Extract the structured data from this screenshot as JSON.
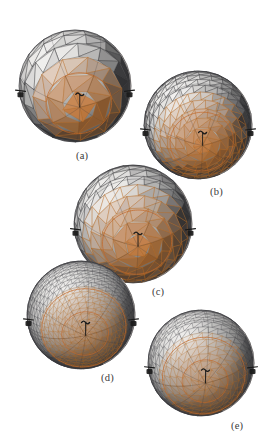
{
  "figure": {
    "background_color": "#ffffff",
    "width": 269,
    "height": 445,
    "type": "scientific-illustration",
    "shading": {
      "light_gray": "#f2f1ef",
      "mid_gray": "#a8a7a5",
      "dark_gray": "#4a4a4c",
      "deep_gray": "#2e2e30",
      "edge_gray": "#35353a",
      "highlight_orange": "#c1682a",
      "mid_orange": "#b5651d",
      "pale_orange": "#d99a6c",
      "marker_black": "#1a1a1a"
    }
  },
  "panels": [
    {
      "id": "a",
      "caption": "(a)",
      "caption_x": 76,
      "caption_y": 150,
      "center_x": 75,
      "center_y": 86,
      "radius": 56,
      "subdivision_level": 1,
      "latitude_bands": 10,
      "longitude_bands": 16,
      "facet_style": "coarse-flat-shaded",
      "pole_marker": true,
      "equator_markers": 2
    },
    {
      "id": "b",
      "caption": "(b)",
      "caption_x": 210,
      "caption_y": 186,
      "center_x": 198,
      "center_y": 125,
      "radius": 54,
      "subdivision_level": 2,
      "latitude_bands": 18,
      "longitude_bands": 28,
      "facet_style": "medium-wireframe",
      "pole_marker": true,
      "equator_markers": 2
    },
    {
      "id": "c",
      "caption": "(c)",
      "caption_x": 152,
      "caption_y": 286,
      "center_x": 133,
      "center_y": 224,
      "radius": 59,
      "subdivision_level": 2,
      "latitude_bands": 14,
      "longitude_bands": 22,
      "facet_style": "medium-flat-shaded",
      "pole_marker": true,
      "equator_markers": 2
    },
    {
      "id": "d",
      "caption": "(d)",
      "caption_x": 101,
      "caption_y": 372,
      "center_x": 81,
      "center_y": 315,
      "radius": 54,
      "subdivision_level": 3,
      "latitude_bands": 30,
      "longitude_bands": 44,
      "facet_style": "fine-wireframe-radial",
      "pole_marker": true,
      "equator_markers": 2
    },
    {
      "id": "e",
      "caption": "(e)",
      "caption_x": 231,
      "caption_y": 420,
      "center_x": 201,
      "center_y": 363,
      "radius": 53,
      "subdivision_level": 3,
      "latitude_bands": 22,
      "longitude_bands": 34,
      "facet_style": "fine-wireframe",
      "pole_marker": true,
      "equator_markers": 2
    }
  ]
}
